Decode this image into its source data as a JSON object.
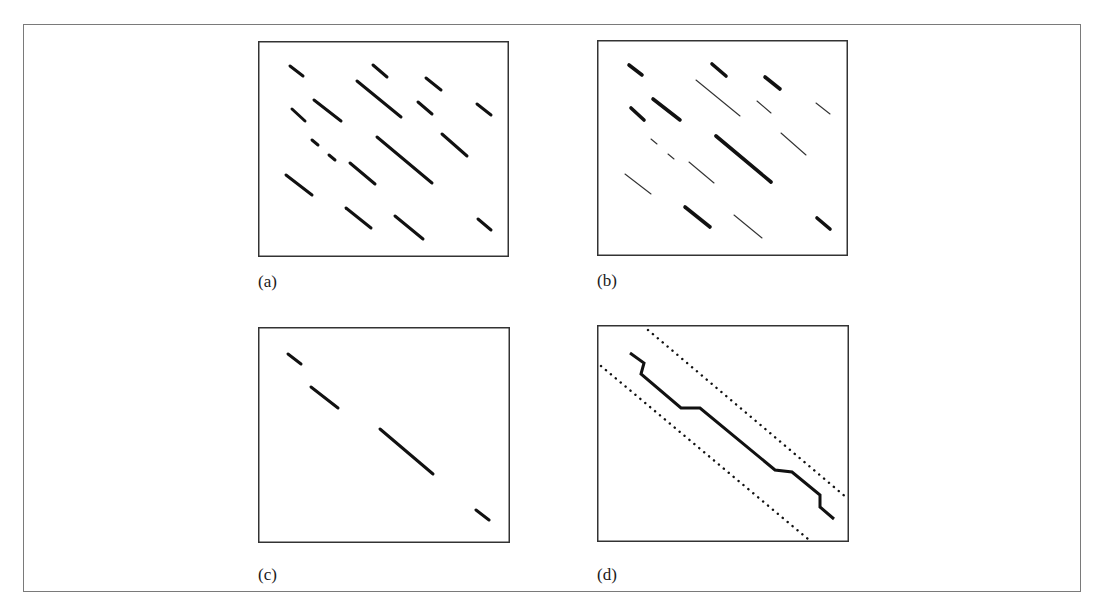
{
  "figure": {
    "panels": [
      {
        "id": "a",
        "caption": "(a)",
        "box": {
          "x": 258,
          "y": 41,
          "w": 251,
          "h": 216
        },
        "caption_pos": {
          "x": 258,
          "y": 273
        },
        "style": "uniform",
        "segments": [
          {
            "x1": 32,
            "y1": 25,
            "x2": 45,
            "y2": 35,
            "w": 3
          },
          {
            "x1": 115,
            "y1": 24,
            "x2": 129,
            "y2": 36,
            "w": 3
          },
          {
            "x1": 168,
            "y1": 37,
            "x2": 183,
            "y2": 49,
            "w": 3
          },
          {
            "x1": 99,
            "y1": 40,
            "x2": 143,
            "y2": 76,
            "w": 3
          },
          {
            "x1": 34,
            "y1": 68,
            "x2": 47,
            "y2": 80,
            "w": 3
          },
          {
            "x1": 56,
            "y1": 59,
            "x2": 83,
            "y2": 80,
            "w": 3
          },
          {
            "x1": 160,
            "y1": 61,
            "x2": 174,
            "y2": 73,
            "w": 3
          },
          {
            "x1": 219,
            "y1": 63,
            "x2": 233,
            "y2": 74,
            "w": 3
          },
          {
            "x1": 54,
            "y1": 99,
            "x2": 60,
            "y2": 104,
            "w": 3
          },
          {
            "x1": 71,
            "y1": 114,
            "x2": 77,
            "y2": 119,
            "w": 3
          },
          {
            "x1": 119,
            "y1": 96,
            "x2": 174,
            "y2": 142,
            "w": 3
          },
          {
            "x1": 184,
            "y1": 93,
            "x2": 209,
            "y2": 115,
            "w": 3
          },
          {
            "x1": 92,
            "y1": 122,
            "x2": 117,
            "y2": 143,
            "w": 3
          },
          {
            "x1": 28,
            "y1": 134,
            "x2": 54,
            "y2": 154,
            "w": 3
          },
          {
            "x1": 88,
            "y1": 167,
            "x2": 113,
            "y2": 187,
            "w": 3
          },
          {
            "x1": 137,
            "y1": 175,
            "x2": 165,
            "y2": 198,
            "w": 3
          },
          {
            "x1": 220,
            "y1": 178,
            "x2": 233,
            "y2": 189,
            "w": 3
          }
        ]
      },
      {
        "id": "b",
        "caption": "(b)",
        "box": {
          "x": 597,
          "y": 40,
          "w": 251,
          "h": 216
        },
        "caption_pos": {
          "x": 597,
          "y": 272
        },
        "style": "weighted",
        "segments": [
          {
            "x1": 32,
            "y1": 25,
            "x2": 45,
            "y2": 35,
            "w": 3.6
          },
          {
            "x1": 115,
            "y1": 24,
            "x2": 129,
            "y2": 36,
            "w": 3.6
          },
          {
            "x1": 168,
            "y1": 37,
            "x2": 183,
            "y2": 49,
            "w": 3.6
          },
          {
            "x1": 99,
            "y1": 40,
            "x2": 143,
            "y2": 76,
            "w": 1.1
          },
          {
            "x1": 34,
            "y1": 68,
            "x2": 47,
            "y2": 80,
            "w": 3.6
          },
          {
            "x1": 56,
            "y1": 59,
            "x2": 83,
            "y2": 80,
            "w": 3.6
          },
          {
            "x1": 160,
            "y1": 61,
            "x2": 174,
            "y2": 73,
            "w": 1.1
          },
          {
            "x1": 219,
            "y1": 63,
            "x2": 233,
            "y2": 74,
            "w": 1.1
          },
          {
            "x1": 54,
            "y1": 99,
            "x2": 60,
            "y2": 104,
            "w": 1.1
          },
          {
            "x1": 71,
            "y1": 114,
            "x2": 77,
            "y2": 119,
            "w": 1.1
          },
          {
            "x1": 119,
            "y1": 96,
            "x2": 174,
            "y2": 142,
            "w": 3.6
          },
          {
            "x1": 184,
            "y1": 93,
            "x2": 209,
            "y2": 115,
            "w": 1.1
          },
          {
            "x1": 92,
            "y1": 122,
            "x2": 117,
            "y2": 143,
            "w": 1.1
          },
          {
            "x1": 28,
            "y1": 134,
            "x2": 54,
            "y2": 154,
            "w": 1.1
          },
          {
            "x1": 88,
            "y1": 167,
            "x2": 113,
            "y2": 187,
            "w": 3.6
          },
          {
            "x1": 137,
            "y1": 175,
            "x2": 165,
            "y2": 198,
            "w": 1.1
          },
          {
            "x1": 220,
            "y1": 178,
            "x2": 233,
            "y2": 189,
            "w": 3.6
          }
        ]
      },
      {
        "id": "c",
        "caption": "(c)",
        "box": {
          "x": 258,
          "y": 327,
          "w": 252,
          "h": 216
        },
        "caption_pos": {
          "x": 258,
          "y": 566
        },
        "style": "uniform",
        "segments": [
          {
            "x1": 30,
            "y1": 27,
            "x2": 43,
            "y2": 37,
            "w": 3
          },
          {
            "x1": 53,
            "y1": 60,
            "x2": 80,
            "y2": 81,
            "w": 3
          },
          {
            "x1": 122,
            "y1": 102,
            "x2": 175,
            "y2": 147,
            "w": 3
          },
          {
            "x1": 218,
            "y1": 183,
            "x2": 231,
            "y2": 193,
            "w": 3
          }
        ]
      },
      {
        "id": "d",
        "caption": "(d)",
        "box": {
          "x": 597,
          "y": 325,
          "w": 252,
          "h": 217
        },
        "caption_pos": {
          "x": 597,
          "y": 566
        },
        "style": "path",
        "path_points": [
          [
            33,
            28
          ],
          [
            47,
            38
          ],
          [
            44,
            49
          ],
          [
            84,
            83
          ],
          [
            103,
            83
          ],
          [
            178,
            145
          ],
          [
            195,
            147
          ],
          [
            223,
            170
          ],
          [
            223,
            182
          ],
          [
            237,
            194
          ]
        ],
        "dotted_lines": [
          {
            "x1": 51,
            "y1": 5,
            "x2": 250,
            "y2": 173
          },
          {
            "x1": 4,
            "y1": 41,
            "x2": 211,
            "y2": 214
          }
        ]
      }
    ]
  },
  "colors": {
    "ink": "#111111",
    "thin_ink": "#333333",
    "frame": "#7a7a7a",
    "panel_border": "#333333",
    "background": "#ffffff"
  }
}
